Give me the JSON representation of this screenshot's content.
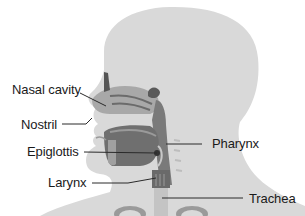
{
  "diagram": {
    "type": "anatomical-illustration",
    "colors": {
      "background": "#ffffff",
      "silhouette": "#d9d9d9",
      "cavity_dark": "#6b6b6b",
      "cavity_mid": "#8c8c8c",
      "tissue_light": "#b3b3b3",
      "leader_line": "#2a2a2a",
      "label_text": "#1a1a1a"
    },
    "labels": [
      {
        "id": "nasal-cavity",
        "text": "Nasal cavity",
        "side": "left"
      },
      {
        "id": "nostril",
        "text": "Nostril",
        "side": "left"
      },
      {
        "id": "epiglottis",
        "text": "Epiglottis",
        "side": "left"
      },
      {
        "id": "larynx",
        "text": "Larynx",
        "side": "left"
      },
      {
        "id": "pharynx",
        "text": "Pharynx",
        "side": "right"
      },
      {
        "id": "trachea",
        "text": "Trachea",
        "side": "right"
      }
    ]
  }
}
